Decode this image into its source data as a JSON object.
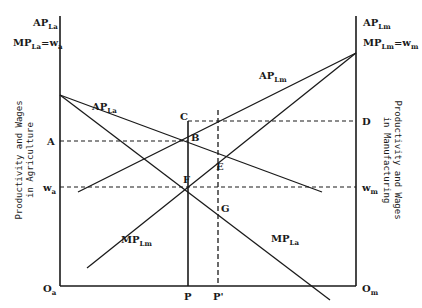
{
  "diagram": {
    "left_axis": {
      "title_line1": "Productivity and Wages",
      "title_line2": "in Agriculture",
      "top_label_1": {
        "main": "AP",
        "sub": "La"
      },
      "top_label_2": {
        "main": "MP",
        "sub": "La",
        "suffix": "=w",
        "suffix_sub": "a"
      },
      "origin": {
        "main": "O",
        "sub": "a"
      },
      "tick_A": "A",
      "tick_wa": {
        "main": "w",
        "sub": "a"
      }
    },
    "right_axis": {
      "title_line1": "Productivity and Wages",
      "title_line2": "in Manufacturing",
      "top_label_1": {
        "main": "AP",
        "sub": "Lm"
      },
      "top_label_2": {
        "main": "MP",
        "sub": "Lm",
        "suffix": "=w",
        "suffix_sub": "m"
      },
      "origin": {
        "main": "O",
        "sub": "m"
      },
      "tick_D": "D",
      "tick_wm": {
        "main": "w",
        "sub": "m"
      }
    },
    "curves": {
      "ap_la": {
        "main": "AP",
        "sub": "La"
      },
      "mp_la": {
        "main": "MP",
        "sub": "La"
      },
      "ap_lm": {
        "main": "AP",
        "sub": "Lm"
      },
      "mp_lm": {
        "main": "MP",
        "sub": "Lm"
      }
    },
    "points": {
      "B": "B",
      "C": "C",
      "E": "E",
      "F": "F",
      "G": "G",
      "P": "P",
      "P_prime": "P'"
    },
    "colors": {
      "line": "#1a1a1a",
      "background": "#ffffff"
    }
  }
}
